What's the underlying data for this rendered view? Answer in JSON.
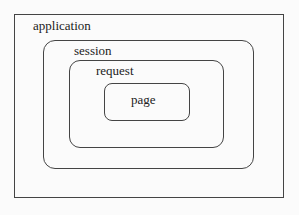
{
  "diagram": {
    "type": "nested scopes",
    "scopes": [
      {
        "label": "application"
      },
      {
        "label": "session"
      },
      {
        "label": "request"
      },
      {
        "label": "page"
      }
    ]
  }
}
